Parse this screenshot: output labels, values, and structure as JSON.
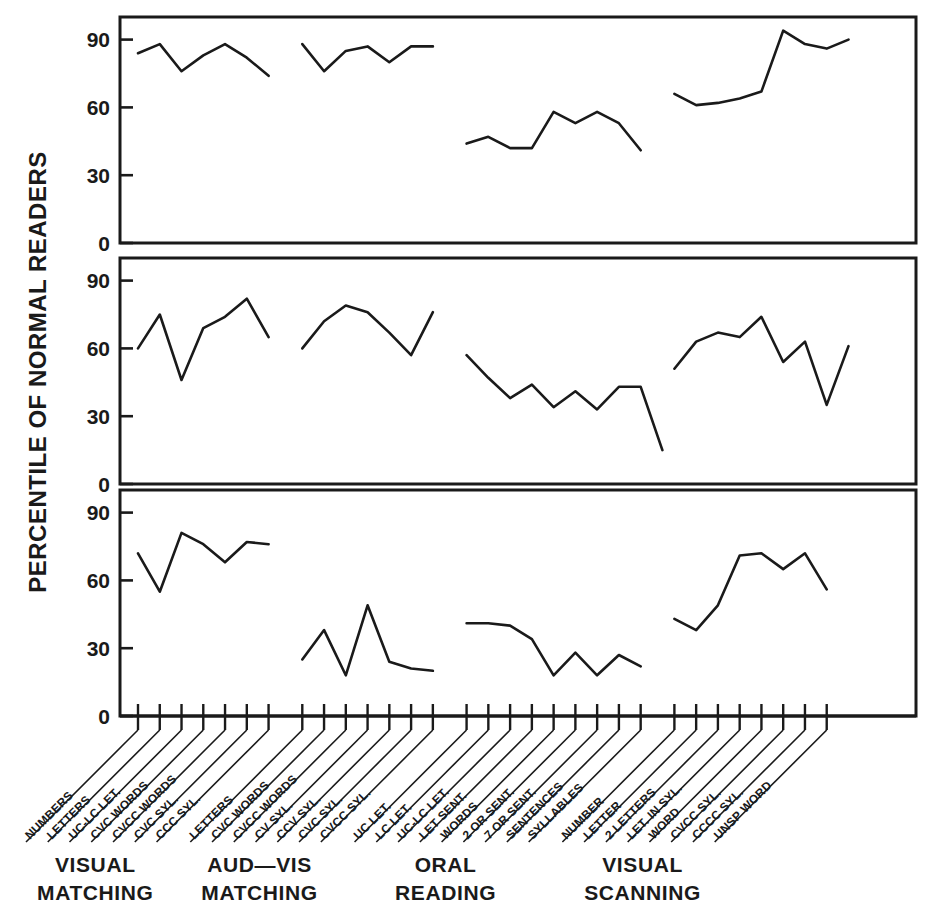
{
  "chart_data": {
    "type": "line",
    "title": "",
    "ylabel": "PERCENTILE OF NORMAL READERS",
    "xlabel": "",
    "ylim": [
      0,
      100
    ],
    "yticks": [
      0,
      30,
      60,
      90
    ],
    "ytick_labels": [
      "0",
      "30",
      "60",
      "90"
    ],
    "grid": false,
    "legend": "none",
    "panels": 3,
    "panel_note": "Three stacked panels, one per subject/group; each panel repeats the same 0-90 percentile axis.",
    "groups": [
      {
        "name": "VISUAL MATCHING",
        "label_line1": "VISUAL",
        "label_line2": "MATCHING",
        "categories": [
          "NUMBERS",
          "LETTERS",
          "UC-LC LET.",
          "CVC WORDS",
          "CVCC WORDS",
          "CVC SYL.",
          "CCC SYL."
        ]
      },
      {
        "name": "AUD-VIS MATCHING",
        "label_line1": "AUD—VIS",
        "label_line2": "MATCHING",
        "categories": [
          "LETTERS",
          "CVC WORDS",
          "CVCC WORDS",
          "CV SYL.",
          "CCV SYL.",
          "CVC SYL.",
          "CVCC SYL."
        ]
      },
      {
        "name": "ORAL READING",
        "label_line1": "ORAL",
        "label_line2": "READING",
        "categories": [
          "UC LET.",
          "LC LET.",
          "UC-LC LET.",
          "LET SENT.",
          "WORDS",
          "2 OR SENT.",
          "7 OR SENT.",
          "SENTENCES",
          "SYLLABLES"
        ]
      },
      {
        "name": "VISUAL SCANNING",
        "label_line1": "VISUAL",
        "label_line2": "SCANNING",
        "categories": [
          "NUMBER",
          "LETTER",
          "2 LETTERS",
          "LET. IN SYL.",
          "WORD",
          "CVCC SYL.",
          "CCCC SYL.",
          "UNSP WORD"
        ]
      }
    ],
    "series": [
      {
        "name": "panel-1",
        "values_by_group": [
          [
            84,
            88,
            76,
            83,
            88,
            82,
            74
          ],
          [
            88,
            76,
            85,
            87,
            80,
            87,
            87
          ],
          [
            44,
            47,
            42,
            42,
            58,
            53,
            58,
            53,
            41
          ],
          [
            66,
            61,
            62,
            64,
            67,
            94,
            88,
            86,
            90
          ]
        ]
      },
      {
        "name": "panel-2",
        "values_by_group": [
          [
            60,
            75,
            46,
            69,
            74,
            82,
            65
          ],
          [
            60,
            72,
            79,
            76,
            67,
            57,
            76
          ],
          [
            57,
            47,
            38,
            44,
            34,
            41,
            33,
            43,
            43,
            15
          ],
          [
            51,
            63,
            67,
            65,
            74,
            54,
            63,
            35,
            61
          ]
        ]
      },
      {
        "name": "panel-3",
        "values_by_group": [
          [
            72,
            55,
            81,
            76,
            68,
            77,
            76
          ],
          [
            25,
            38,
            18,
            49,
            24,
            21,
            20
          ],
          [
            41,
            41,
            40,
            34,
            18,
            28,
            18,
            27,
            22
          ],
          [
            43,
            38,
            49,
            71,
            72,
            65,
            72,
            56
          ]
        ]
      }
    ]
  }
}
